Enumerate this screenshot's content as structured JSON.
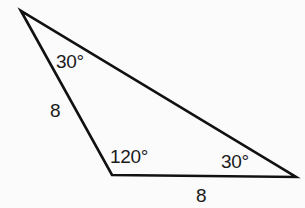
{
  "diagram": {
    "type": "triangle",
    "vertices": {
      "top": {
        "x": 21,
        "y": 11
      },
      "bottom_left": {
        "x": 112,
        "y": 175
      },
      "right": {
        "x": 296,
        "y": 177
      }
    },
    "colors": {
      "line": "#111111",
      "text": "#1a1a1a",
      "background": "#fbfbfb"
    },
    "angles": {
      "top": "30°",
      "bottom_left": "120°",
      "right": "30°"
    },
    "sides": {
      "left": "8",
      "bottom": "8"
    }
  }
}
